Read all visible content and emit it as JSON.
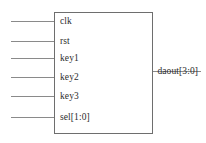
{
  "diagram": {
    "type": "rtl-block-symbol",
    "canvas": {
      "width": 206,
      "height": 143
    },
    "colors": {
      "background": "#ffffff",
      "outline": "#6e6e6e",
      "wire": "#8a8a8a",
      "text": "#2c2c2c"
    },
    "block": {
      "x": 54,
      "y": 12,
      "width": 99,
      "height": 122
    },
    "inputs": [
      {
        "label": "clk",
        "y": 21,
        "wire_x_start": 11,
        "wire_x_end": 54
      },
      {
        "label": "rst",
        "y": 41,
        "wire_x_start": 11,
        "wire_x_end": 54
      },
      {
        "label": "key1",
        "y": 58,
        "wire_x_start": 11,
        "wire_x_end": 54
      },
      {
        "label": "key2",
        "y": 77,
        "wire_x_start": 11,
        "wire_x_end": 54
      },
      {
        "label": "key3",
        "y": 96,
        "wire_x_start": 11,
        "wire_x_end": 54
      },
      {
        "label": "sel[1:0]",
        "y": 117,
        "wire_x_start": 11,
        "wire_x_end": 54
      }
    ],
    "outputs": [
      {
        "label": "daout[3:0]",
        "y": 71,
        "wire_x_start": 153,
        "wire_x_end": 201
      }
    ]
  }
}
